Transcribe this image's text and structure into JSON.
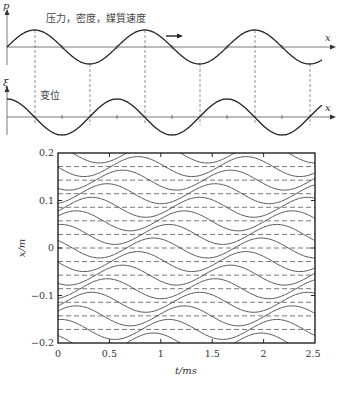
{
  "top_panel": {
    "pressure_wave": {
      "y_axis_label": "p",
      "x_axis_label": "x",
      "caption": "压力，密度，媒質速度",
      "direction_arrow": "right-arrow"
    },
    "displacement_wave": {
      "y_axis_label": "ξ",
      "x_axis_label": "x",
      "caption": "变位"
    }
  },
  "chart_data": {
    "type": "line",
    "title": "",
    "xlabel": "t/ms",
    "ylabel": "x/m",
    "xlim": [
      0,
      2.5
    ],
    "ylim": [
      -0.2,
      0.2
    ],
    "x_ticks": [
      "0",
      "0.5",
      "1",
      "1.5",
      "2",
      "2.5"
    ],
    "y_ticks": [
      "0.2",
      "0.1",
      "0",
      "−0.1",
      "−0.2"
    ],
    "grid": false,
    "equilibrium_positions": [
      -0.171,
      -0.143,
      -0.114,
      -0.086,
      -0.057,
      -0.029,
      0,
      0.029,
      0.057,
      0.086,
      0.114,
      0.143,
      0.171
    ],
    "amplitude_m": 0.021,
    "period_ms": 1.05,
    "wavelength_m": 0.2
  }
}
